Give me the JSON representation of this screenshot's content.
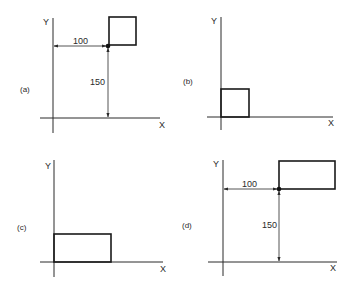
{
  "figure": {
    "panels": [
      {
        "tag": "(a)",
        "x_axis_label": "X",
        "y_axis_label": "Y",
        "shape": "square",
        "reference_point_dot": true,
        "dimensions": {
          "horizontal": "100",
          "vertical": "150"
        }
      },
      {
        "tag": "(b)",
        "x_axis_label": "X",
        "y_axis_label": "Y",
        "shape": "square",
        "reference_point_dot": false
      },
      {
        "tag": "(c)",
        "x_axis_label": "X",
        "y_axis_label": "Y",
        "shape": "rectangle",
        "reference_point_dot": false
      },
      {
        "tag": "(d)",
        "x_axis_label": "X",
        "y_axis_label": "Y",
        "shape": "rectangle",
        "reference_point_dot": true,
        "dimensions": {
          "horizontal": "100",
          "vertical": "150"
        }
      }
    ],
    "colors": {
      "ink": "#1a1a1a",
      "background": "#ffffff"
    }
  }
}
